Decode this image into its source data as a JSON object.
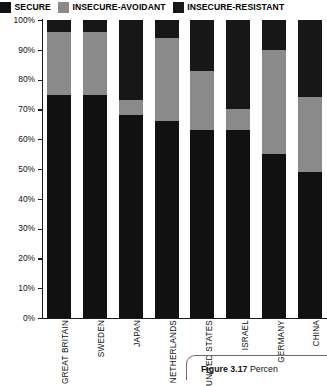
{
  "legend": {
    "items": [
      {
        "label": "SECURE",
        "color": "#111111",
        "icon": "legend-swatch-secure"
      },
      {
        "label": "INSECURE-AVOIDANT",
        "color": "#8a8a8a",
        "icon": "legend-swatch-insecure-avoidant"
      },
      {
        "label": "INSECURE-RESISTANT",
        "color": "#171717",
        "icon": "legend-swatch-insecure-resistant"
      }
    ]
  },
  "caption": {
    "figure_number": "Figure 3.17",
    "text": "Percen"
  },
  "chart_data": {
    "type": "bar",
    "stacked": true,
    "title": "",
    "xlabel": "",
    "ylabel": "",
    "ylim": [
      0,
      100
    ],
    "grid": false,
    "legend_position": "top",
    "ytick_labels": [
      "100%",
      "90%",
      "80%",
      "70%",
      "60%",
      "50%",
      "40%",
      "30%",
      "20%",
      "10%",
      "0%"
    ],
    "ytick_values": [
      100,
      90,
      80,
      70,
      60,
      50,
      40,
      30,
      20,
      10,
      0
    ],
    "categories": [
      "GREAT BRITAIN",
      "SWEDEN",
      "JAPAN",
      "NETHERLANDS",
      "UNITED STATES",
      "ISRAEL",
      "GERMANY",
      "CHINA"
    ],
    "series": [
      {
        "name": "SECURE",
        "color": "#111111",
        "values": [
          75,
          75,
          68,
          66,
          63,
          63,
          55,
          49
        ]
      },
      {
        "name": "INSECURE-AVOIDANT",
        "color": "#8a8a8a",
        "values": [
          21,
          21,
          5,
          28,
          20,
          7,
          35,
          25
        ]
      },
      {
        "name": "INSECURE-RESISTANT",
        "color": "#171717",
        "values": [
          4,
          4,
          27,
          6,
          17,
          30,
          10,
          26
        ]
      }
    ]
  }
}
